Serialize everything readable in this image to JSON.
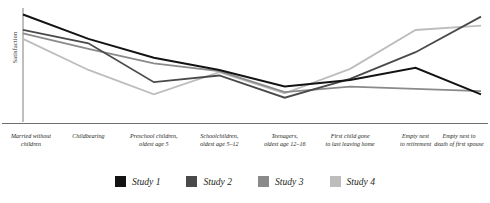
{
  "chart_data": {
    "type": "line",
    "title": "",
    "xlabel": "",
    "ylabel": "Satisfaction",
    "grid": false,
    "legend_position": "bottom",
    "ylim": [
      0,
      100
    ],
    "axis_ticks_shown": false,
    "categories": [
      "Married without children",
      "Childbearing",
      "Preschool children, oldest age 5",
      "Schoolchildren, oldest age 5–12",
      "Teenagers, oldest age 12–16",
      "First child gone to last leaving home",
      "Empty nest to retirement",
      "Empty nest to death of first spouse"
    ],
    "series": [
      {
        "name": "Study 1",
        "color": "#131313",
        "values": [
          96,
          74,
          57,
          46,
          31,
          37,
          48,
          24
        ]
      },
      {
        "name": "Study 2",
        "color": "#4a4a4a",
        "values": [
          82,
          70,
          35,
          41,
          21,
          38,
          62,
          94
        ]
      },
      {
        "name": "Study 3",
        "color": "#8a8a8a",
        "values": [
          79,
          65,
          52,
          45,
          26,
          31,
          29,
          27
        ]
      },
      {
        "name": "Study 4",
        "color": "#bdbdbd",
        "values": [
          74,
          46,
          24,
          44,
          25,
          47,
          82,
          86
        ]
      }
    ]
  },
  "axes": {
    "y_label": "Satisfaction"
  },
  "x_labels": [
    {
      "line1": "Married without",
      "line2": "children"
    },
    {
      "line1": "Childbearing",
      "line2": ""
    },
    {
      "line1": "Preschool children,",
      "line2": "oldest age 5"
    },
    {
      "line1": "Schoolchildren,",
      "line2": "oldest age 5–12"
    },
    {
      "line1": "Teenagers,",
      "line2": "oldest age 12–16"
    },
    {
      "line1": "First child gone",
      "line2": "to last leaving home"
    },
    {
      "line1": "Empty nest",
      "line2": "to retirement"
    },
    {
      "line1": "Empty nest to",
      "line2": "death of first spouse"
    }
  ],
  "legend": {
    "items": [
      {
        "label": "Study 1",
        "color": "#131313"
      },
      {
        "label": "Study 2",
        "color": "#4a4a4a"
      },
      {
        "label": "Study 3",
        "color": "#8a8a8a"
      },
      {
        "label": "Study 4",
        "color": "#bdbdbd"
      }
    ]
  },
  "style": {
    "axis_color": "#6f6f6f",
    "text_color": "#231f20",
    "background": "#ffffff"
  }
}
